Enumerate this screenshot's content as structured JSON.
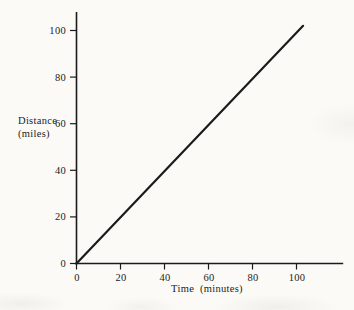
{
  "page": {
    "background_color": "#fbfaf7",
    "ink_color": "#1b1b1b"
  },
  "chart_data": {
    "type": "line",
    "title": "",
    "xlabel": "Time  (minutes)",
    "ylabel": "Distance (miles)",
    "ylabel_lines": [
      "Distance",
      "(miles)"
    ],
    "x_ticks": [
      0,
      20,
      40,
      60,
      80,
      100
    ],
    "y_ticks": [
      0,
      20,
      40,
      60,
      80,
      100
    ],
    "xlim": [
      0,
      121
    ],
    "ylim": [
      0,
      108
    ],
    "grid": false,
    "legend": false,
    "series": [
      {
        "name": "distance-vs-time-line",
        "points": [
          [
            0,
            0
          ],
          [
            103,
            102
          ]
        ]
      }
    ]
  }
}
